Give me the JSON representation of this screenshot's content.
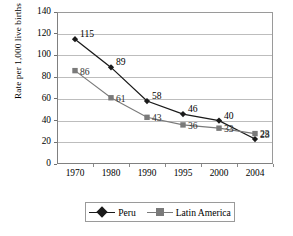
{
  "chart_data": {
    "type": "line",
    "title": "",
    "xlabel": "",
    "ylabel": "Rate per 1,000 live births",
    "categories": [
      "1970",
      "1980",
      "1990",
      "1995",
      "2000",
      "2004"
    ],
    "ylim": [
      0,
      140
    ],
    "yticks": [
      "0",
      "20",
      "40",
      "60",
      "80",
      "100",
      "120",
      "140"
    ],
    "grid": "horizontal",
    "legend_position": "bottom",
    "series": [
      {
        "name": "Peru",
        "color": "#1a1a1a",
        "marker": "diamond",
        "values": [
          115,
          89,
          58,
          46,
          40,
          23
        ],
        "labels": [
          "115",
          "89",
          "58",
          "46",
          "40",
          "23"
        ]
      },
      {
        "name": "Latin America",
        "color": "#7a7a7a",
        "marker": "square",
        "values": [
          86,
          61,
          43,
          36,
          33,
          28
        ],
        "labels": [
          "86",
          "61",
          "43",
          "36",
          "33",
          "28"
        ]
      }
    ]
  },
  "legend": {
    "entries": [
      {
        "label": "Peru"
      },
      {
        "label": "Latin America"
      }
    ]
  },
  "colors": {
    "peru": "#1a1a1a",
    "latin_america": "#7a7a7a",
    "grid": "#bdbdbd",
    "axis": "#808080"
  }
}
